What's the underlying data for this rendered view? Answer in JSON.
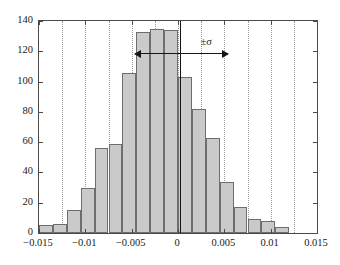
{
  "chart_data": {
    "type": "bar",
    "title": "",
    "subtitle": "",
    "xlabel": "",
    "ylabel": "",
    "xlim": [
      -0.015,
      0.015
    ],
    "ylim": [
      0,
      140
    ],
    "grid": "vertical-dotted",
    "legend": "none",
    "bin_width": 0.0015,
    "bin_edges": [
      -0.015,
      -0.0135,
      -0.012,
      -0.0105,
      -0.009,
      -0.0075,
      -0.006,
      -0.0045,
      -0.003,
      -0.0015,
      0.0,
      0.0015,
      0.003,
      0.0045,
      0.006,
      0.0075,
      0.009,
      0.0105,
      0.012,
      0.0135,
      0.015
    ],
    "categories": [
      "-0.01425",
      "-0.01275",
      "-0.01125",
      "-0.00975",
      "-0.00825",
      "-0.00675",
      "-0.00525",
      "-0.00375",
      "-0.00225",
      "-0.00075",
      "0.00075",
      "0.00225",
      "0.00375",
      "0.00525",
      "0.00675",
      "0.00825",
      "0.00975",
      "0.01125",
      "0.01275",
      "0.01425"
    ],
    "values": [
      5,
      6,
      15,
      30,
      56,
      59,
      106,
      133,
      135,
      134,
      103,
      82,
      63,
      34,
      17,
      9,
      8,
      4,
      0,
      0
    ],
    "series": [
      {
        "name": "counts",
        "values": [
          5,
          6,
          15,
          30,
          56,
          59,
          106,
          133,
          135,
          134,
          103,
          82,
          63,
          34,
          17,
          9,
          8,
          4,
          0,
          0
        ]
      }
    ],
    "xticks": [
      -0.015,
      -0.01,
      -0.005,
      0,
      0.005,
      0.01,
      0.015
    ],
    "xticklabels": [
      "−0.015",
      "−0.01",
      "−0.005",
      "0",
      "0.005",
      "0.01",
      "0.015"
    ],
    "yticks": [
      0,
      20,
      40,
      60,
      80,
      100,
      120,
      140
    ],
    "yticklabels": [
      "0",
      "20",
      "40",
      "60",
      "80",
      "100",
      "120",
      "140"
    ],
    "gridline_x": [
      -0.0125,
      -0.01,
      -0.0075,
      -0.005,
      -0.0025,
      0,
      0.0025,
      0.005,
      0.0075,
      0.01,
      0.0125
    ],
    "annotations": [
      {
        "name": "mean-line",
        "kind": "vline",
        "x": 0.0002,
        "label": ""
      },
      {
        "name": "sigma-span",
        "kind": "double-arrow",
        "label": "±σ",
        "x_start": -0.00465,
        "x_end": 0.00545,
        "y": 118
      }
    ],
    "colors": {
      "bar_fill": "#cacaca",
      "bar_edge": "#6e6e6e",
      "axis": "#4a4a4a",
      "gridline": "#9a9a9a",
      "annotation": "#151515",
      "background": "#ffffff"
    }
  }
}
